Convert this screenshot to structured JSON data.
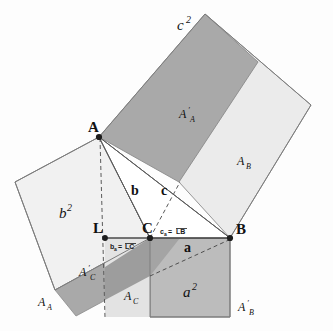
{
  "figure": {
    "background_color": "#fdfdfd"
  },
  "colors": {
    "dark_fill": "#a9a9a9",
    "medium_fill": "#bdbdbd",
    "light_fill": "#ededed",
    "very_light_fill": "#f2f2f2",
    "stroke": "#6e6e6e",
    "line": "#555555",
    "text": "#111111"
  },
  "vertices": [
    {
      "id": "A",
      "label": "A",
      "x": 99,
      "y": 137
    },
    {
      "id": "B",
      "label": "B",
      "x": 230,
      "y": 238
    },
    {
      "id": "C",
      "label": "C",
      "x": 150,
      "y": 238
    },
    {
      "id": "L",
      "label": "L",
      "x": 105,
      "y": 238
    }
  ],
  "side_labels": [
    {
      "id": "b",
      "label": "b",
      "x": 131,
      "y": 195
    },
    {
      "id": "c",
      "label": "c",
      "x": 163,
      "y": 195
    },
    {
      "id": "a",
      "label": "a",
      "x": 186,
      "y": 250
    }
  ],
  "square_labels": [
    {
      "id": "c2",
      "base": "c",
      "exponent": "2",
      "x": 186,
      "y": 26
    },
    {
      "id": "b2",
      "base": "b",
      "exponent": "2",
      "x": 63,
      "y": 215
    },
    {
      "id": "a2",
      "base": "a",
      "exponent": "2",
      "x": 188,
      "y": 295
    }
  ],
  "area_labels": [
    {
      "id": "A_prime_A",
      "base": "A",
      "prime": "′",
      "sub": "A",
      "x": 186,
      "y": 117
    },
    {
      "id": "A_B",
      "base": "A",
      "prime": "",
      "sub": "B",
      "x": 244,
      "y": 164
    },
    {
      "id": "A_prime_C",
      "base": "A",
      "prime": "′",
      "sub": "C",
      "x": 86,
      "y": 275
    },
    {
      "id": "A_A",
      "base": "A",
      "prime": "",
      "sub": "A",
      "x": 44,
      "y": 305
    },
    {
      "id": "A_C",
      "base": "A",
      "prime": "",
      "sub": "C",
      "x": 131,
      "y": 299
    },
    {
      "id": "A_prime_B",
      "base": "A",
      "prime": "′",
      "sub": "B",
      "x": 245,
      "y": 310
    }
  ],
  "segment_labels": [
    {
      "id": "b_a",
      "symbol": "b",
      "subscript": "a",
      "equals": "=",
      "segment": "LC",
      "overline": true,
      "x": 112,
      "y": 247
    },
    {
      "id": "c_a",
      "symbol": "c",
      "subscript": "a",
      "equals": "=",
      "segment": "LB",
      "overline": true,
      "x": 162,
      "y": 232
    }
  ],
  "shapes": {
    "square_c2_dark": {
      "name": "square-on-hypotenuse-dark-part",
      "points": "99,137 205,14 258,62 179,182"
    },
    "square_c2_light": {
      "name": "square-on-hypotenuse-light-part",
      "points": "205,14 311,105 230,238 179,182 258,62"
    },
    "square_b2": {
      "name": "square-on-side-b",
      "points": "99,137 15,182 55,290 150,238"
    },
    "square_a2": {
      "name": "square-on-side-a",
      "points": "150,238 230,238 230,317 150,317"
    },
    "region_A_prime_C": {
      "name": "region-a-prime-c",
      "points": "55,290 150,238 150,275 75,315"
    },
    "region_A_C_band": {
      "name": "region-a-c-band",
      "points": "105,238 150,238 150,317 105,317"
    },
    "region_a2_dark_wedge": {
      "name": "region-a2-dark-wedge",
      "points": "150,238 180,238 150,275"
    },
    "triangle_ABC": {
      "name": "right-triangle",
      "points": "99,137 150,238 230,238"
    }
  },
  "lines": {
    "altitude_dashed": {
      "name": "altitude-A-to-L",
      "x1": 99,
      "y1": 137,
      "x2": 105,
      "y2": 317
    },
    "hypotenuse_dashed": {
      "name": "projection-C-to-corner",
      "x1": 150,
      "y1": 275,
      "x2": 230,
      "y2": 238
    },
    "c_dashed": {
      "name": "dashed-c-to-B",
      "x1": 150,
      "y1": 238,
      "x2": 179,
      "y2": 182
    },
    "baseline": {
      "name": "baseline-L-to-B",
      "x1": 105,
      "y1": 238,
      "x2": 230,
      "y2": 238
    }
  }
}
